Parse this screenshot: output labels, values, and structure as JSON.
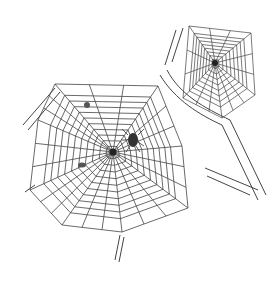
{
  "image": {
    "caption": "Line drawing of two spider webs with spiders and insects, attached to tree branches",
    "subject": "spider webs",
    "style": "black line illustration on white",
    "colors": {
      "background": "#ffffff",
      "ink": "#333333"
    }
  },
  "webs": [
    {
      "name": "large-web",
      "center": [
        113,
        152
      ],
      "rings": 10,
      "frame": [
        [
          55,
          84
        ],
        [
          158,
          86
        ],
        [
          182,
          146
        ],
        [
          188,
          208
        ],
        [
          122,
          232
        ],
        [
          62,
          225
        ],
        [
          30,
          190
        ],
        [
          38,
          120
        ]
      ]
    },
    {
      "name": "small-web",
      "center": [
        215,
        63
      ],
      "rings": 8,
      "frame": [
        [
          189,
          26
        ],
        [
          251,
          33
        ],
        [
          255,
          95
        ],
        [
          222,
          118
        ],
        [
          183,
          98
        ]
      ]
    }
  ]
}
